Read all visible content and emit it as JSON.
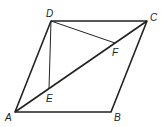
{
  "figure": {
    "type": "parallelogram-geometry",
    "points": {
      "A": {
        "label": "A",
        "x": 15,
        "y": 112
      },
      "B": {
        "label": "B",
        "x": 111,
        "y": 112
      },
      "C": {
        "label": "C",
        "x": 147,
        "y": 21
      },
      "D": {
        "label": "D",
        "x": 51,
        "y": 21
      },
      "E": {
        "label": "E",
        "x": 49,
        "y": 89
      },
      "F": {
        "label": "F",
        "x": 115,
        "y": 43
      }
    },
    "segments": [
      "AB",
      "BC",
      "CD",
      "DA",
      "AC",
      "DE",
      "DF"
    ],
    "stroke_color": "#222222"
  }
}
